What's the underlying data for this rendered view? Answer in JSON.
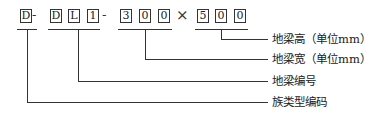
{
  "code": {
    "chars": [
      "D",
      "D",
      "L",
      "1",
      "3",
      "0",
      "0",
      "5",
      "0",
      "0"
    ],
    "separators": [
      "-",
      "-",
      "×"
    ]
  },
  "labels": {
    "beam_height": "地梁高（单位mm）",
    "beam_width": "地梁宽（单位mm）",
    "beam_number": "地梁编号",
    "family_type_code": "族类型编码"
  }
}
